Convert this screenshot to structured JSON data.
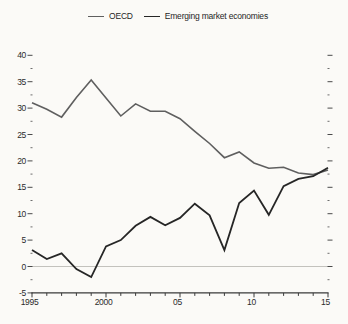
{
  "chart_data": {
    "type": "line",
    "title": "",
    "x": [
      1995,
      1996,
      1997,
      1998,
      1999,
      2000,
      2001,
      2002,
      2003,
      2004,
      2005,
      2006,
      2007,
      2008,
      2009,
      2010,
      2011,
      2012,
      2013,
      2014,
      2015
    ],
    "series": [
      {
        "name": "OECD",
        "color": "#5f5f5f",
        "values": [
          31.0,
          29.8,
          28.3,
          32.0,
          35.3,
          31.9,
          28.5,
          30.8,
          29.4,
          29.4,
          28.0,
          25.6,
          23.3,
          20.6,
          21.7,
          19.6,
          18.6,
          18.8,
          17.7,
          17.4,
          18.3
        ]
      },
      {
        "name": "Emerging market economies",
        "color": "#262626",
        "values": [
          3.1,
          1.4,
          2.5,
          -0.5,
          -2.0,
          3.8,
          5.0,
          7.7,
          9.4,
          7.8,
          9.2,
          11.9,
          9.7,
          3.1,
          12.0,
          14.4,
          9.8,
          15.2,
          16.6,
          17.1,
          18.7
        ]
      }
    ],
    "ylim": [
      -5,
      41.5
    ],
    "xlim": [
      1995,
      2015
    ],
    "grid": false,
    "zero_line": true,
    "legend_position": "top",
    "yticks": [
      {
        "v": 40,
        "label": "40"
      },
      {
        "v": 35,
        "label": "35"
      },
      {
        "v": 30,
        "label": "30"
      },
      {
        "v": 25,
        "label": "25"
      },
      {
        "v": 20,
        "label": "20"
      },
      {
        "v": 15,
        "label": "15"
      },
      {
        "v": 10,
        "label": "10"
      },
      {
        "v": 5,
        "label": "5"
      },
      {
        "v": 0,
        "label": "0"
      },
      {
        "v": -5,
        "label": "-5"
      }
    ],
    "yticks_minor": [
      37.5,
      32.5,
      27.5,
      22.5,
      17.5,
      12.5,
      7.5,
      2.5,
      -2.5
    ],
    "xticks": [
      {
        "year": 1995,
        "label": "1995"
      },
      {
        "year": 2000,
        "label": "2000"
      },
      {
        "year": 2005,
        "label": "05"
      },
      {
        "year": 2010,
        "label": "10"
      },
      {
        "year": 2015,
        "label": "15"
      }
    ]
  },
  "colors": {
    "background": "#fbfaf7",
    "axis": "#3a3a3a",
    "tick": "#4a4a4a",
    "zero_line": "#c3c2bd",
    "label": "#2b2b2b"
  }
}
